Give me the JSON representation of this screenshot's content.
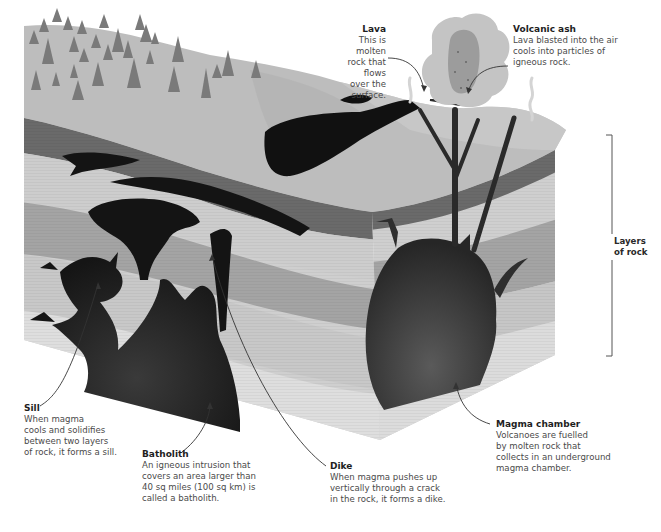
{
  "diagram": {
    "colors": {
      "background": "#ffffff",
      "surface": "#bdbdbd",
      "surface_far": "#c8c8c8",
      "trees": "#7a7a7a",
      "dark_band": "#6a6a6a",
      "layer_light": "#cfcfcf",
      "layer_mid": "#a9a9a9",
      "layer_pale": "#dcdcdc",
      "magma": "#141414",
      "magma_chamber": "#3c3c3c",
      "ash_outer": "#c4c4c4",
      "ash_inner": "#9c9c9c",
      "text_title": "#1e1e1e",
      "text_body": "#4a4a4a"
    },
    "labels": {
      "lava": {
        "title": "Lava",
        "line1": "This is molten",
        "line2": "rock that flows",
        "line3": "over the surface."
      },
      "volcanic_ash": {
        "title": "Volcanic ash",
        "line1": "Lava blasted into the air",
        "line2": "cools into particles of",
        "line3": "igneous rock."
      },
      "layers_of_rock": {
        "line1": "Layers",
        "line2": "of rock"
      },
      "sill": {
        "title": "Sill",
        "line1": "When magma",
        "line2": "cools and solidifies",
        "line3": "between two layers",
        "line4": "of rock, it forms a sill."
      },
      "batholith": {
        "title": "Batholith",
        "line1": "An igneous intrusion that",
        "line2": "covers an area larger than",
        "line3": "40 sq miles (100 sq km) is",
        "line4": "called a batholith."
      },
      "dike": {
        "title": "Dike",
        "line1": "When magma pushes up",
        "line2": "vertically through a crack",
        "line3": "in the rock, it forms a dike."
      },
      "magma_chamber": {
        "title": "Magma chamber",
        "line1": "Volcanoes are fuelled",
        "line2": "by molten rock that",
        "line3": "collects in an underground",
        "line4": "magma chamber."
      }
    }
  }
}
